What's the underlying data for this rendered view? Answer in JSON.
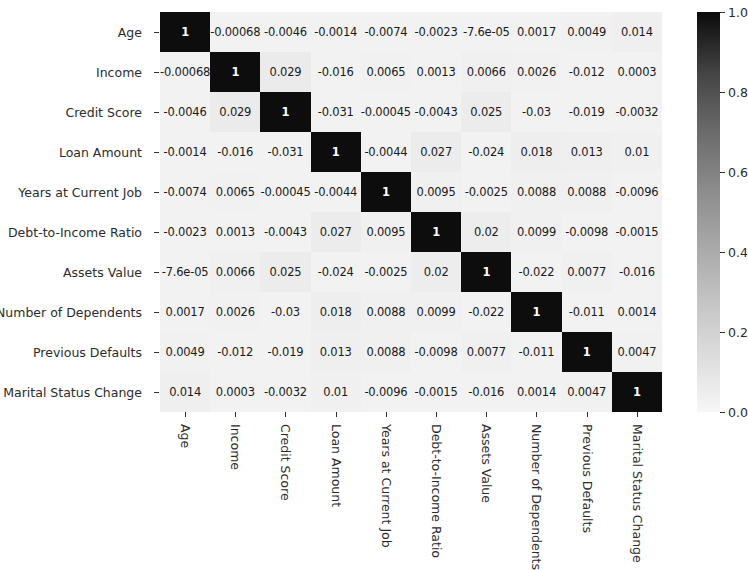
{
  "chart_data": {
    "type": "heatmap",
    "title": "",
    "xlabel": "",
    "ylabel": "",
    "colormap": "greys",
    "grid": false,
    "legend_position": "right",
    "colorbar": {
      "ticks": [
        "1.0",
        "0.8",
        "0.6",
        "0.4",
        "0.2",
        "0.0"
      ],
      "tick_values": [
        1.0,
        0.8,
        0.6,
        0.4,
        0.2,
        0.0
      ],
      "vmin": 0.0,
      "vmax": 1.0
    },
    "categories": [
      "Age",
      "Income",
      "Credit Score",
      "Loan Amount",
      "Years at Current Job",
      "Debt-to-Income Ratio",
      "Assets Value",
      "Number of Dependents",
      "Previous Defaults",
      "Marital Status Change"
    ],
    "x_tick_labels": [
      "Age",
      "Income",
      "Credit Score",
      "Loan Amount",
      "Years at Current Job",
      "Debt-to-Income Ratio",
      "Assets Value",
      "Number of Dependents",
      "Previous Defaults",
      "Marital Status Change"
    ],
    "y_tick_labels": [
      "Age",
      "Income",
      "Credit Score",
      "Loan Amount",
      "Years at Current Job",
      "Debt-to-Income Ratio",
      "Assets Value",
      "Number of Dependents",
      "Previous Defaults",
      "Marital Status Change"
    ],
    "annotations": [
      [
        "1",
        "-0.00068",
        "-0.0046",
        "-0.0014",
        "-0.0074",
        "-0.0023",
        "-7.6e-05",
        "0.0017",
        "0.0049",
        "0.014"
      ],
      [
        "-0.00068",
        "1",
        "0.029",
        "-0.016",
        "0.0065",
        "0.0013",
        "0.0066",
        "0.0026",
        "-0.012",
        "0.0003"
      ],
      [
        "-0.0046",
        "0.029",
        "1",
        "-0.031",
        "-0.00045",
        "-0.0043",
        "0.025",
        "-0.03",
        "-0.019",
        "-0.0032"
      ],
      [
        "-0.0014",
        "-0.016",
        "-0.031",
        "1",
        "-0.0044",
        "0.027",
        "-0.024",
        "0.018",
        "0.013",
        "0.01"
      ],
      [
        "-0.0074",
        "0.0065",
        "-0.00045",
        "-0.0044",
        "1",
        "0.0095",
        "-0.0025",
        "0.0088",
        "0.0088",
        "-0.0096"
      ],
      [
        "-0.0023",
        "0.0013",
        "-0.0043",
        "0.027",
        "0.0095",
        "1",
        "0.02",
        "0.0099",
        "-0.0098",
        "-0.0015"
      ],
      [
        "-7.6e-05",
        "0.0066",
        "0.025",
        "-0.024",
        "-0.0025",
        "0.02",
        "1",
        "-0.022",
        "0.0077",
        "-0.016"
      ],
      [
        "0.0017",
        "0.0026",
        "-0.03",
        "0.018",
        "0.0088",
        "0.0099",
        "-0.022",
        "1",
        "-0.011",
        "0.0014"
      ],
      [
        "0.0049",
        "-0.012",
        "-0.019",
        "0.013",
        "0.0088",
        "-0.0098",
        "0.0077",
        "-0.011",
        "1",
        "0.0047"
      ],
      [
        "0.014",
        "0.0003",
        "-0.0032",
        "0.01",
        "-0.0096",
        "-0.0015",
        "-0.016",
        "0.0014",
        "0.0047",
        "1"
      ]
    ],
    "values": [
      [
        1.0,
        -0.00068,
        -0.0046,
        -0.0014,
        -0.0074,
        -0.0023,
        -7.6e-05,
        0.0017,
        0.0049,
        0.014
      ],
      [
        -0.00068,
        1.0,
        0.029,
        -0.016,
        0.0065,
        0.0013,
        0.0066,
        0.0026,
        -0.012,
        0.0003
      ],
      [
        -0.0046,
        0.029,
        1.0,
        -0.031,
        -0.00045,
        -0.0043,
        0.025,
        -0.03,
        -0.019,
        -0.0032
      ],
      [
        -0.0014,
        -0.016,
        -0.031,
        1.0,
        -0.0044,
        0.027,
        -0.024,
        0.018,
        0.013,
        0.01
      ],
      [
        -0.0074,
        0.0065,
        -0.00045,
        -0.0044,
        1.0,
        0.0095,
        -0.0025,
        0.0088,
        0.0088,
        -0.0096
      ],
      [
        -0.0023,
        0.0013,
        -0.0043,
        0.027,
        0.0095,
        1.0,
        0.02,
        0.0099,
        -0.0098,
        -0.0015
      ],
      [
        -7.6e-05,
        0.0066,
        0.025,
        -0.024,
        -0.0025,
        0.02,
        1.0,
        -0.022,
        0.0077,
        -0.016
      ],
      [
        0.0017,
        0.0026,
        -0.03,
        0.018,
        0.0088,
        0.0099,
        -0.022,
        1.0,
        -0.011,
        0.0014
      ],
      [
        0.0049,
        -0.012,
        -0.019,
        0.013,
        0.0088,
        -0.0098,
        0.0077,
        -0.011,
        1.0,
        0.0047
      ],
      [
        0.014,
        0.0003,
        -0.0032,
        0.01,
        -0.0096,
        -0.0015,
        -0.016,
        0.0014,
        0.0047,
        1.0
      ]
    ]
  },
  "colors": {
    "cell_low": "#e8e8e8",
    "cell_high": "#0d0d0d",
    "diagonal_text": "#ffffff",
    "offdiagonal_text": "#1a1a1a",
    "background": "#ffffff",
    "tick": "#333333"
  }
}
